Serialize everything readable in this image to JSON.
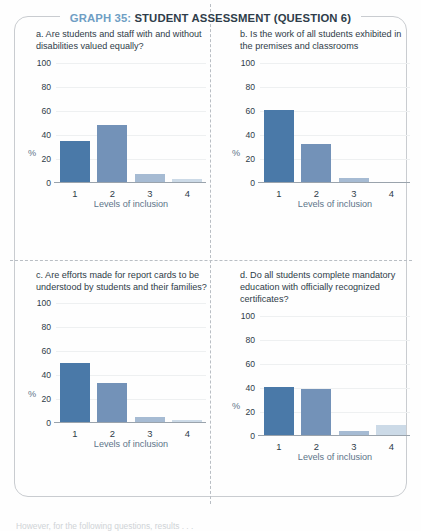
{
  "title": {
    "graph_number": "GRAPH 35:",
    "graph_name": "STUDENT ASSESSMENT (QUESTION 6)"
  },
  "caption": "However, for the following questions, results . . .",
  "axis": {
    "ylabel": "%",
    "xlabel": "Levels of inclusion",
    "yticks": [
      "100",
      "80",
      "60",
      "40",
      "20",
      "0"
    ],
    "xticks": [
      "1",
      "2",
      "3",
      "4"
    ]
  },
  "colors": {
    "bar1": "#4a79a8",
    "bar2": "#7392b8",
    "bar3": "#a6bbd3",
    "bar4": "#ccdae7",
    "title_accent": "#6f9ec4",
    "title_main": "#2f3d4a",
    "axis_label": "#5d7489",
    "frame": "#c9ccd0"
  },
  "chart_data": [
    {
      "type": "bar",
      "panel": "a",
      "title": "a. Are students and staff with and without disabilities valued equally?",
      "categories": [
        "1",
        "2",
        "3",
        "4"
      ],
      "values": [
        35,
        48,
        7,
        3
      ],
      "xlabel": "Levels of inclusion",
      "ylabel": "%",
      "ylim": [
        0,
        100
      ],
      "grid": true,
      "legend": "none"
    },
    {
      "type": "bar",
      "panel": "b",
      "title": "b. Is the work of all students exhibited in the premises and classrooms",
      "categories": [
        "1",
        "2",
        "3",
        "4"
      ],
      "values": [
        61,
        32,
        4,
        1
      ],
      "xlabel": "Levels of inclusion",
      "ylabel": "%",
      "ylim": [
        0,
        100
      ],
      "grid": true,
      "legend": "none"
    },
    {
      "type": "bar",
      "panel": "c",
      "title": "c. Are efforts made for report cards to be understood by students and their families?",
      "categories": [
        "1",
        "2",
        "3",
        "4"
      ],
      "values": [
        50,
        34,
        5,
        3
      ],
      "xlabel": "Levels of inclusion",
      "ylabel": "%",
      "ylim": [
        0,
        100
      ],
      "grid": true,
      "legend": "none"
    },
    {
      "type": "bar",
      "panel": "d",
      "title": "d. Do all students complete mandatory education with officially recognized certificates?",
      "categories": [
        "1",
        "2",
        "3",
        "4"
      ],
      "values": [
        41,
        39,
        4,
        9
      ],
      "xlabel": "Levels of inclusion",
      "ylabel": "%",
      "ylim": [
        0,
        100
      ],
      "grid": true,
      "legend": "none"
    }
  ]
}
